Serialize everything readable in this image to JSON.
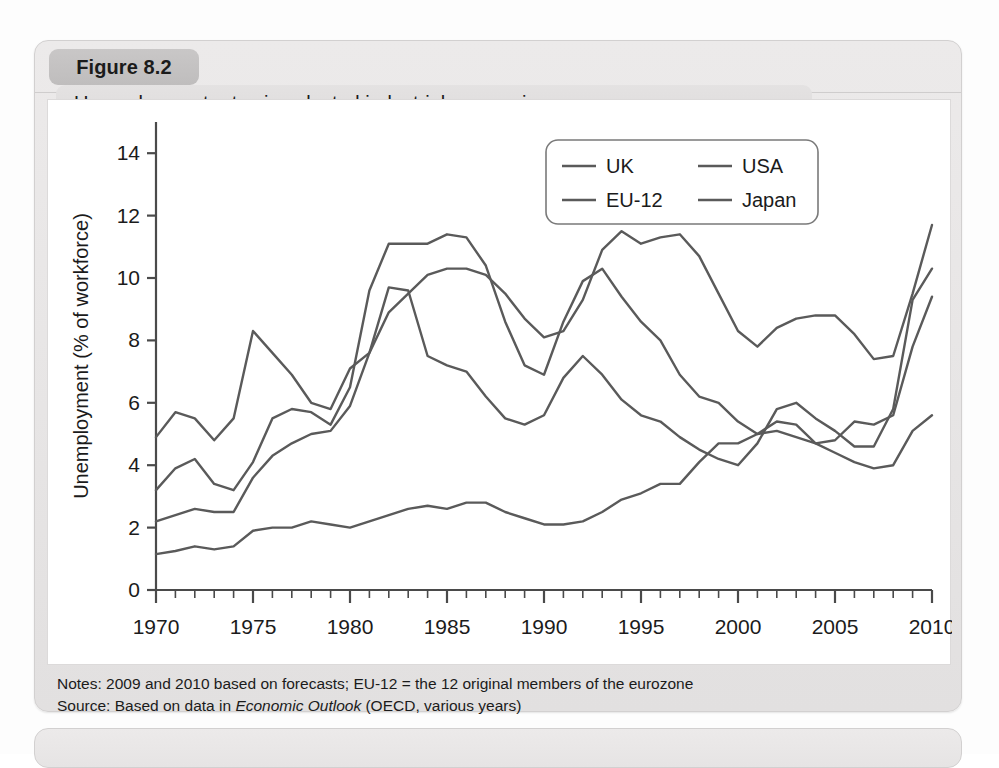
{
  "figure": {
    "number_label": "Figure 8.2",
    "title": "Unemployment rates in selected industrial economies",
    "notes": "Notes: 2009 and 2010 based on forecasts; EU-12 = the 12 original members of the eurozone",
    "source_prefix": "Source: Based on data in ",
    "source_italic": "Economic Outlook",
    "source_suffix": " (OECD, various years)"
  },
  "chart_data": {
    "type": "line",
    "title": "Unemployment rates in selected industrial economies",
    "xlabel": "",
    "ylabel": "Unemployment (% of workforce)",
    "xlim": [
      1970,
      2010
    ],
    "ylim": [
      0,
      15
    ],
    "yticks": [
      0,
      2,
      4,
      6,
      8,
      10,
      12,
      14
    ],
    "ytick_labels": [
      "0",
      "2",
      "4",
      "6",
      "8",
      "10",
      "12",
      "14"
    ],
    "xticks": [
      1970,
      1975,
      1980,
      1985,
      1990,
      1995,
      2000,
      2005,
      2010
    ],
    "xtick_labels": [
      "1970",
      "1975",
      "1980",
      "1985",
      "1990",
      "1995",
      "2000",
      "2005",
      "2010"
    ],
    "minor_xtick_step": 1,
    "grid": false,
    "legend_position": "top-right",
    "line_color": "#5a5a5a",
    "x": [
      1970,
      1971,
      1972,
      1973,
      1974,
      1975,
      1976,
      1977,
      1978,
      1979,
      1980,
      1981,
      1982,
      1983,
      1984,
      1985,
      1986,
      1987,
      1988,
      1989,
      1990,
      1991,
      1992,
      1993,
      1994,
      1995,
      1996,
      1997,
      1998,
      1999,
      2000,
      2001,
      2002,
      2003,
      2004,
      2005,
      2006,
      2007,
      2008,
      2009,
      2010
    ],
    "series": [
      {
        "name": "UK",
        "values": [
          3.2,
          3.9,
          4.2,
          3.4,
          3.2,
          4.1,
          5.5,
          5.8,
          5.7,
          5.3,
          6.5,
          9.6,
          11.1,
          11.1,
          11.1,
          11.4,
          11.3,
          10.4,
          8.6,
          7.2,
          6.9,
          8.6,
          9.9,
          10.3,
          9.4,
          8.6,
          8.0,
          6.9,
          6.2,
          6.0,
          5.4,
          5.0,
          5.1,
          4.9,
          4.7,
          4.8,
          5.4,
          5.3,
          5.6,
          7.8,
          9.4
        ]
      },
      {
        "name": "USA",
        "values": [
          4.9,
          5.7,
          5.5,
          4.8,
          5.5,
          8.3,
          7.6,
          6.9,
          6.0,
          5.8,
          7.1,
          7.6,
          9.7,
          9.6,
          7.5,
          7.2,
          7.0,
          6.2,
          5.5,
          5.3,
          5.6,
          6.8,
          7.5,
          6.9,
          6.1,
          5.6,
          5.4,
          4.9,
          4.5,
          4.2,
          4.0,
          4.7,
          5.8,
          6.0,
          5.5,
          5.1,
          4.6,
          4.6,
          5.8,
          9.3,
          10.3
        ]
      },
      {
        "name": "EU-12",
        "values": [
          2.2,
          2.4,
          2.6,
          2.5,
          2.5,
          3.6,
          4.3,
          4.7,
          5.0,
          5.1,
          5.9,
          7.6,
          8.9,
          9.5,
          10.1,
          10.3,
          10.3,
          10.1,
          9.5,
          8.7,
          8.1,
          8.3,
          9.3,
          10.9,
          11.5,
          11.1,
          11.3,
          11.4,
          10.7,
          9.5,
          8.3,
          7.8,
          8.4,
          8.7,
          8.8,
          8.8,
          8.2,
          7.4,
          7.5,
          9.5,
          11.7
        ]
      },
      {
        "name": "Japan",
        "values": [
          1.15,
          1.25,
          1.4,
          1.3,
          1.4,
          1.9,
          2.0,
          2.0,
          2.2,
          2.1,
          2.0,
          2.2,
          2.4,
          2.6,
          2.7,
          2.6,
          2.8,
          2.8,
          2.5,
          2.3,
          2.1,
          2.1,
          2.2,
          2.5,
          2.9,
          3.1,
          3.4,
          3.4,
          4.1,
          4.7,
          4.7,
          5.0,
          5.4,
          5.3,
          4.7,
          4.4,
          4.1,
          3.9,
          4.0,
          5.1,
          5.6
        ]
      }
    ]
  },
  "legend": {
    "items": [
      {
        "label": "UK"
      },
      {
        "label": "USA"
      },
      {
        "label": "EU-12"
      },
      {
        "label": "Japan"
      }
    ]
  }
}
